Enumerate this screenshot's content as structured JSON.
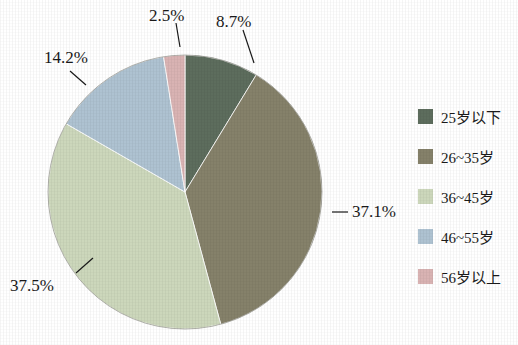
{
  "chart_data": {
    "type": "pie",
    "title": "",
    "subtitle": "",
    "xlabel": "",
    "ylabel": "",
    "legend_position": "right",
    "grid": false,
    "categories": [
      "25岁以下",
      "26~35岁",
      "36~45岁",
      "46~55岁",
      "56岁以上"
    ],
    "values": [
      8.7,
      37.1,
      37.5,
      14.2,
      2.5
    ],
    "value_labels": [
      "8.7%",
      "37.1%",
      "37.5%",
      "14.2%",
      "2.5%"
    ],
    "colors": [
      "#5d6d5d",
      "#85816a",
      "#ccd7bb",
      "#aec2d1",
      "#d9b3b3"
    ],
    "start_angle_deg": 0,
    "direction": "clockwise",
    "slices": [
      {
        "label": "25岁以下",
        "value": 8.7,
        "display": "8.7%",
        "color": "#5d6d5d"
      },
      {
        "label": "26~35岁",
        "value": 37.1,
        "display": "37.1%",
        "color": "#85816a"
      },
      {
        "label": "36~45岁",
        "value": 37.5,
        "display": "37.5%",
        "color": "#ccd7bb"
      },
      {
        "label": "46~55岁",
        "value": 14.2,
        "display": "14.2%",
        "color": "#aec2d1"
      },
      {
        "label": "56岁以上",
        "value": 2.5,
        "display": "2.5%",
        "color": "#d9b3b3"
      }
    ]
  },
  "labels": {
    "pct_25_under": "8.7%",
    "pct_26_35": "37.1%",
    "pct_36_45": "37.5%",
    "pct_46_55": "14.2%",
    "pct_56_over": "2.5%"
  },
  "legend": {
    "items": [
      {
        "label": "25岁以下",
        "color": "#5d6d5d"
      },
      {
        "label": "26~35岁",
        "color": "#85816a"
      },
      {
        "label": "36~45岁",
        "color": "#ccd7bb"
      },
      {
        "label": "46~55岁",
        "color": "#aec2d1"
      },
      {
        "label": "56岁以上",
        "color": "#d9b3b3"
      }
    ]
  }
}
